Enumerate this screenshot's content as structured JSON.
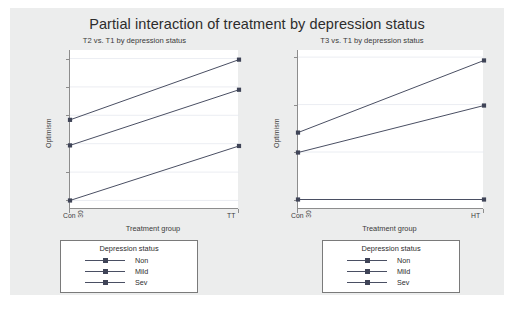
{
  "chart_data": {
    "type": "line",
    "title": "Partial interaction of treatment by depression status",
    "panels": [
      {
        "subtitle": "T2 vs. T1 by depression status",
        "xlabel": "Treatment group",
        "ylabel": "Optimism",
        "categories": [
          "Con",
          "TT"
        ],
        "xticklabels": [
          "Con",
          "TT"
        ],
        "yticks": [
          30,
          35,
          40,
          45,
          50,
          55
        ],
        "ylim": [
          28.5,
          56.5
        ],
        "grid": true,
        "legend_position": "below",
        "series": [
          {
            "name": "Non",
            "values": [
              44.2,
              54.8
            ]
          },
          {
            "name": "Mild",
            "values": [
              39.7,
              49.5
            ]
          },
          {
            "name": "Sev",
            "values": [
              30.0,
              39.6
            ]
          }
        ]
      },
      {
        "subtitle": "T3 vs. T1 by depression status",
        "xlabel": "Treatment group",
        "ylabel": "Optimism",
        "categories": [
          "Con",
          "HT"
        ],
        "xticklabels": [
          "Con",
          "HT"
        ],
        "yticks": [
          30,
          40,
          50,
          60
        ],
        "ylim": [
          28.0,
          61.5
        ],
        "grid": true,
        "legend_position": "below",
        "series": [
          {
            "name": "Non",
            "values": [
              44.1,
              59.3
            ]
          },
          {
            "name": "Mild",
            "values": [
              39.9,
              49.8
            ]
          },
          {
            "name": "Sev",
            "values": [
              30.0,
              30.0
            ]
          }
        ]
      }
    ],
    "legend": {
      "title": "Depression status",
      "entries": [
        "Non",
        "Mild",
        "Sev"
      ]
    },
    "colors": {
      "line": "#4a4f63",
      "marker": "#3f4457",
      "grid": "#e6e9ef",
      "axis": "#8d8d8d",
      "background": "#eceded",
      "plot_background": "#ffffff",
      "text": "#2c2c2c"
    }
  }
}
